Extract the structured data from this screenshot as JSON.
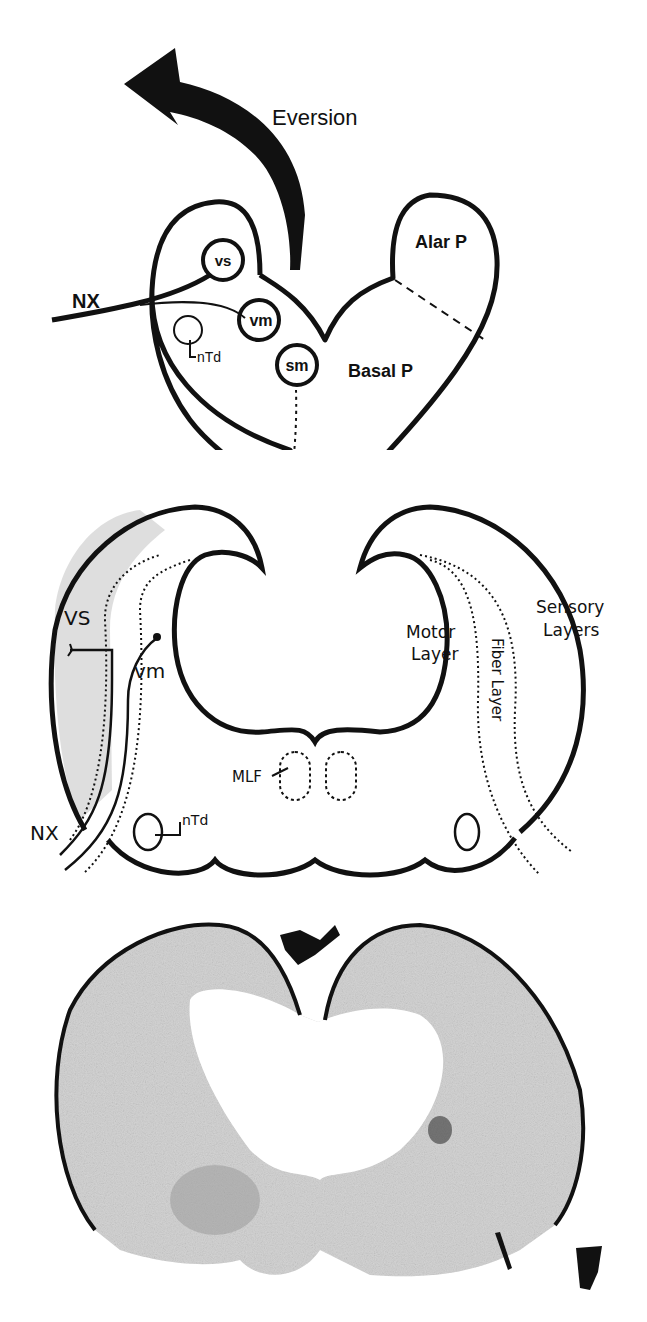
{
  "figure": {
    "panels": [
      {
        "id": "a",
        "description": "Schematic cross-section of developing brainstem with eversion arrow",
        "labels": {
          "eversion": "Eversion",
          "alar": "Alar P",
          "basal": "Basal P",
          "nerve": "NX",
          "vs": "vs",
          "vm": "vm",
          "sm": "sm",
          "ntd": "nTd",
          "nsm": "Nsm"
        }
      },
      {
        "id": "b",
        "description": "Schematic of everted vagal lobe layers",
        "labels": {
          "vs": "VS",
          "vm": "vm",
          "nerve": "NX",
          "ntd": "nTd",
          "mlf": "MLF",
          "motor_line1": "Motor",
          "motor_line2": "Layer",
          "fiber": "Fiber Layer",
          "sensory_line1": "Sensory",
          "sensory_line2": "Layers"
        }
      },
      {
        "id": "c",
        "description": "Histological section of vagal lobe (photomicrograph)"
      }
    ],
    "colors": {
      "ink": "#111111",
      "shade": "#c8c8c8",
      "background": "#ffffff"
    }
  }
}
